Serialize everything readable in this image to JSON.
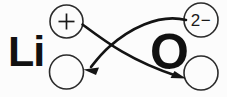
{
  "diagram": {
    "type": "ionic-bond-electron-transfer",
    "background_color": "#fcfcfc",
    "ink_color": "#141414",
    "stroke_color": "#2b2b2b",
    "elements": [
      {
        "id": "lithium",
        "symbol": "Li",
        "name": "lithium-symbol",
        "x": 26,
        "y": 50,
        "font_size": 40
      },
      {
        "id": "oxygen",
        "symbol": "O",
        "name": "oxygen-symbol",
        "x": 166,
        "y": 50,
        "font_size": 46
      }
    ],
    "circles": [
      {
        "id": "li-charge-circle",
        "name": "lithium-charge-circle",
        "cx": 66.5,
        "cy": 21.5,
        "r": 16.5,
        "label": "+",
        "label_type": "plus-sign"
      },
      {
        "id": "li-electron-circle",
        "name": "lithium-electron-circle",
        "cx": 66.5,
        "cy": 72,
        "r": 17,
        "label": "",
        "label_type": "empty"
      },
      {
        "id": "o-charge-circle",
        "name": "oxygen-charge-circle",
        "cx": 201,
        "cy": 20,
        "r": 17,
        "label": "2−",
        "label_type": "text",
        "font_size": 16
      },
      {
        "id": "o-electron-circle",
        "name": "oxygen-electron-circle",
        "cx": 201,
        "cy": 73,
        "r": 17,
        "label": "",
        "label_type": "empty"
      }
    ],
    "arrows": [
      {
        "id": "arrow-li-to-o",
        "name": "electron-transfer-arrow-right",
        "from": "li-charge-circle",
        "to": "o-electron-circle",
        "direction": "left-to-right",
        "path": "M 82.5 24.5 C 104 41 130 60 178 76.5",
        "head_x": 184,
        "head_y": 78,
        "head_angle": 20
      },
      {
        "id": "arrow-o-to-li",
        "name": "electron-transfer-arrow-left",
        "from": "o-charge-circle",
        "to": "li-electron-circle",
        "direction": "right-to-left",
        "path": "M 185 20.5 C 160 16 130 30 110 47 C 102 54 95 62 90 67",
        "head_x": 84.5,
        "head_y": 69.5,
        "head_angle": 200
      }
    ]
  }
}
